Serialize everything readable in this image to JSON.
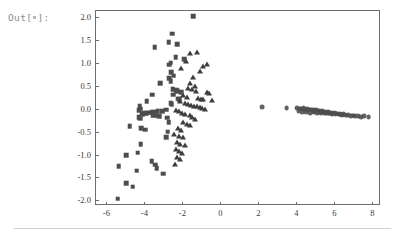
{
  "cell": {
    "out_label_prefix": "Out[",
    "out_label_suffix": "]:",
    "placeholder_icon": "collapsed-cell-dot-icon"
  },
  "chart_data": {
    "type": "scatter",
    "title": "",
    "subtitle": "",
    "xlabel": "",
    "ylabel": "",
    "xlim": [
      -6.6,
      8.4
    ],
    "ylim": [
      -2.1,
      2.15
    ],
    "grid": false,
    "legend": null,
    "frame": true,
    "xticks": [
      -6,
      -4,
      -2,
      0,
      2,
      4,
      6,
      8
    ],
    "xtick_labels": [
      "-6",
      "-4",
      "-2",
      "0",
      "2",
      "4",
      "6",
      "8"
    ],
    "yticks": [
      2.0,
      1.5,
      1.0,
      0.5,
      0.0,
      -0.5,
      -1.0,
      -1.5,
      -2.0
    ],
    "ytick_labels": [
      "2.0",
      "1.5",
      "1.0",
      "0.5",
      "0.0",
      "-0.5",
      "-1.0",
      "-1.5",
      "-2.0"
    ],
    "marker_color": "#4d4d4d",
    "series": [
      {
        "name": "squares",
        "marker": "square",
        "color": "#4d4d4d",
        "points": [
          [
            -1.42,
            2.02
          ],
          [
            -2.55,
            1.63
          ],
          [
            -2.72,
            1.45
          ],
          [
            -2.28,
            1.4
          ],
          [
            -3.45,
            1.34
          ],
          [
            -2.36,
            1.12
          ],
          [
            -1.92,
            1.08
          ],
          [
            -2.62,
            1.0
          ],
          [
            -2.7,
            0.96
          ],
          [
            -2.58,
            0.79
          ],
          [
            -2.45,
            0.72
          ],
          [
            -2.7,
            0.66
          ],
          [
            -2.62,
            0.6
          ],
          [
            -3.18,
            0.56
          ],
          [
            -2.5,
            0.42
          ],
          [
            -2.32,
            0.4
          ],
          [
            -2.26,
            0.38
          ],
          [
            -2.05,
            0.36
          ],
          [
            -2.48,
            0.3
          ],
          [
            -3.6,
            0.3
          ],
          [
            -2.22,
            0.22
          ],
          [
            -2.18,
            0.2
          ],
          [
            -3.88,
            0.16
          ],
          [
            -2.62,
            0.12
          ],
          [
            -2.56,
            0.1
          ],
          [
            -4.25,
            0.05
          ],
          [
            -4.2,
            0.0
          ],
          [
            -4.28,
            -0.04
          ],
          [
            -2.86,
            -0.02
          ],
          [
            -3.05,
            -0.05
          ],
          [
            -3.3,
            -0.06
          ],
          [
            -3.46,
            -0.07
          ],
          [
            -3.62,
            -0.08
          ],
          [
            -3.74,
            -0.09
          ],
          [
            -3.88,
            -0.1
          ],
          [
            -4.02,
            -0.1
          ],
          [
            -4.12,
            -0.12
          ],
          [
            -3.55,
            -0.14
          ],
          [
            -3.38,
            -0.15
          ],
          [
            -3.22,
            -0.16
          ],
          [
            -4.3,
            -0.18
          ],
          [
            -4.22,
            -0.22
          ],
          [
            -2.8,
            -0.2
          ],
          [
            -2.72,
            -0.3
          ],
          [
            -4.78,
            -0.38
          ],
          [
            -4.18,
            -0.42
          ],
          [
            -3.96,
            -0.46
          ],
          [
            -2.78,
            -0.5
          ],
          [
            -2.84,
            -0.62
          ],
          [
            -4.2,
            -0.78
          ],
          [
            -4.35,
            -0.96
          ],
          [
            -4.95,
            -1.02
          ],
          [
            -3.62,
            -1.14
          ],
          [
            -3.42,
            -1.22
          ],
          [
            -3.36,
            -1.3
          ],
          [
            -5.35,
            -1.26
          ],
          [
            -4.4,
            -1.35
          ],
          [
            -3.02,
            -1.42
          ],
          [
            -4.95,
            -1.62
          ],
          [
            -4.62,
            -1.7
          ],
          [
            -5.4,
            -1.96
          ]
        ]
      },
      {
        "name": "triangles",
        "marker": "triangle",
        "color": "#3d3d3d",
        "points": [
          [
            -1.6,
            1.22
          ],
          [
            -1.22,
            1.24
          ],
          [
            -1.82,
            1.04
          ],
          [
            -0.72,
            0.98
          ],
          [
            -0.92,
            0.94
          ],
          [
            -2.05,
            0.88
          ],
          [
            -1.1,
            0.82
          ],
          [
            -1.42,
            0.7
          ],
          [
            -1.62,
            0.56
          ],
          [
            -1.35,
            0.5
          ],
          [
            -1.7,
            0.44
          ],
          [
            -1.52,
            0.42
          ],
          [
            -1.28,
            0.38
          ],
          [
            -0.72,
            0.36
          ],
          [
            -0.58,
            0.34
          ],
          [
            -1.95,
            0.3
          ],
          [
            -1.78,
            0.26
          ],
          [
            -1.18,
            0.24
          ],
          [
            -1.02,
            0.22
          ],
          [
            -0.9,
            0.2
          ],
          [
            -0.45,
            0.18
          ],
          [
            -2.12,
            0.16
          ],
          [
            -1.88,
            0.12
          ],
          [
            -1.72,
            0.1
          ],
          [
            -1.55,
            0.08
          ],
          [
            -1.4,
            0.06
          ],
          [
            -1.25,
            0.05
          ],
          [
            -1.1,
            0.03
          ],
          [
            -0.95,
            0.02
          ],
          [
            -0.8,
            0.0
          ],
          [
            -2.35,
            -0.02
          ],
          [
            -2.2,
            -0.06
          ],
          [
            -2.02,
            -0.1
          ],
          [
            -1.85,
            -0.12
          ],
          [
            -1.62,
            -0.14
          ],
          [
            -1.48,
            -0.18
          ],
          [
            -1.32,
            -0.22
          ],
          [
            -1.95,
            -0.3
          ],
          [
            -1.78,
            -0.34
          ],
          [
            -1.62,
            -0.36
          ],
          [
            -2.25,
            -0.42
          ],
          [
            -2.08,
            -0.46
          ],
          [
            -2.42,
            -0.56
          ],
          [
            -2.18,
            -0.6
          ],
          [
            -1.98,
            -0.62
          ],
          [
            -2.3,
            -0.72
          ],
          [
            -2.12,
            -0.76
          ],
          [
            -1.88,
            -0.8
          ],
          [
            -2.35,
            -0.88
          ],
          [
            -2.2,
            -0.92
          ],
          [
            -2.02,
            -0.96
          ],
          [
            -2.28,
            -1.06
          ],
          [
            -2.15,
            -1.1
          ],
          [
            -2.38,
            -1.2
          ]
        ]
      },
      {
        "name": "circles",
        "marker": "circle",
        "color": "#4d4d4d",
        "points": [
          [
            2.18,
            0.04
          ],
          [
            3.48,
            0.02
          ],
          [
            4.05,
            0.02
          ],
          [
            4.18,
            0.0
          ],
          [
            4.28,
            -0.01
          ],
          [
            4.38,
            0.01
          ],
          [
            4.46,
            -0.02
          ],
          [
            4.55,
            -0.01
          ],
          [
            4.62,
            -0.03
          ],
          [
            4.7,
            -0.02
          ],
          [
            4.78,
            -0.04
          ],
          [
            4.86,
            -0.03
          ],
          [
            4.94,
            -0.05
          ],
          [
            5.02,
            -0.04
          ],
          [
            5.1,
            -0.06
          ],
          [
            5.18,
            -0.05
          ],
          [
            5.26,
            -0.07
          ],
          [
            5.34,
            -0.06
          ],
          [
            5.42,
            -0.08
          ],
          [
            5.5,
            -0.07
          ],
          [
            5.58,
            -0.09
          ],
          [
            5.66,
            -0.08
          ],
          [
            5.74,
            -0.1
          ],
          [
            5.82,
            -0.09
          ],
          [
            5.9,
            -0.11
          ],
          [
            5.98,
            -0.1
          ],
          [
            6.06,
            -0.12
          ],
          [
            6.14,
            -0.11
          ],
          [
            6.22,
            -0.13
          ],
          [
            6.32,
            -0.12
          ],
          [
            6.42,
            -0.14
          ],
          [
            6.52,
            -0.13
          ],
          [
            6.62,
            -0.15
          ],
          [
            6.74,
            -0.14
          ],
          [
            6.86,
            -0.16
          ],
          [
            6.98,
            -0.15
          ],
          [
            7.1,
            -0.17
          ],
          [
            7.24,
            -0.16
          ],
          [
            7.4,
            -0.18
          ],
          [
            7.58,
            -0.17
          ],
          [
            7.8,
            -0.19
          ],
          [
            4.12,
            -0.06
          ],
          [
            4.32,
            -0.08
          ],
          [
            4.52,
            -0.07
          ],
          [
            4.72,
            -0.09
          ],
          [
            4.9,
            -0.08
          ],
          [
            5.08,
            -0.1
          ],
          [
            5.28,
            -0.09
          ],
          [
            5.48,
            -0.11
          ],
          [
            5.68,
            -0.1
          ],
          [
            5.88,
            -0.12
          ],
          [
            6.08,
            -0.11
          ],
          [
            6.28,
            -0.13
          ],
          [
            6.48,
            -0.12
          ]
        ]
      }
    ]
  }
}
